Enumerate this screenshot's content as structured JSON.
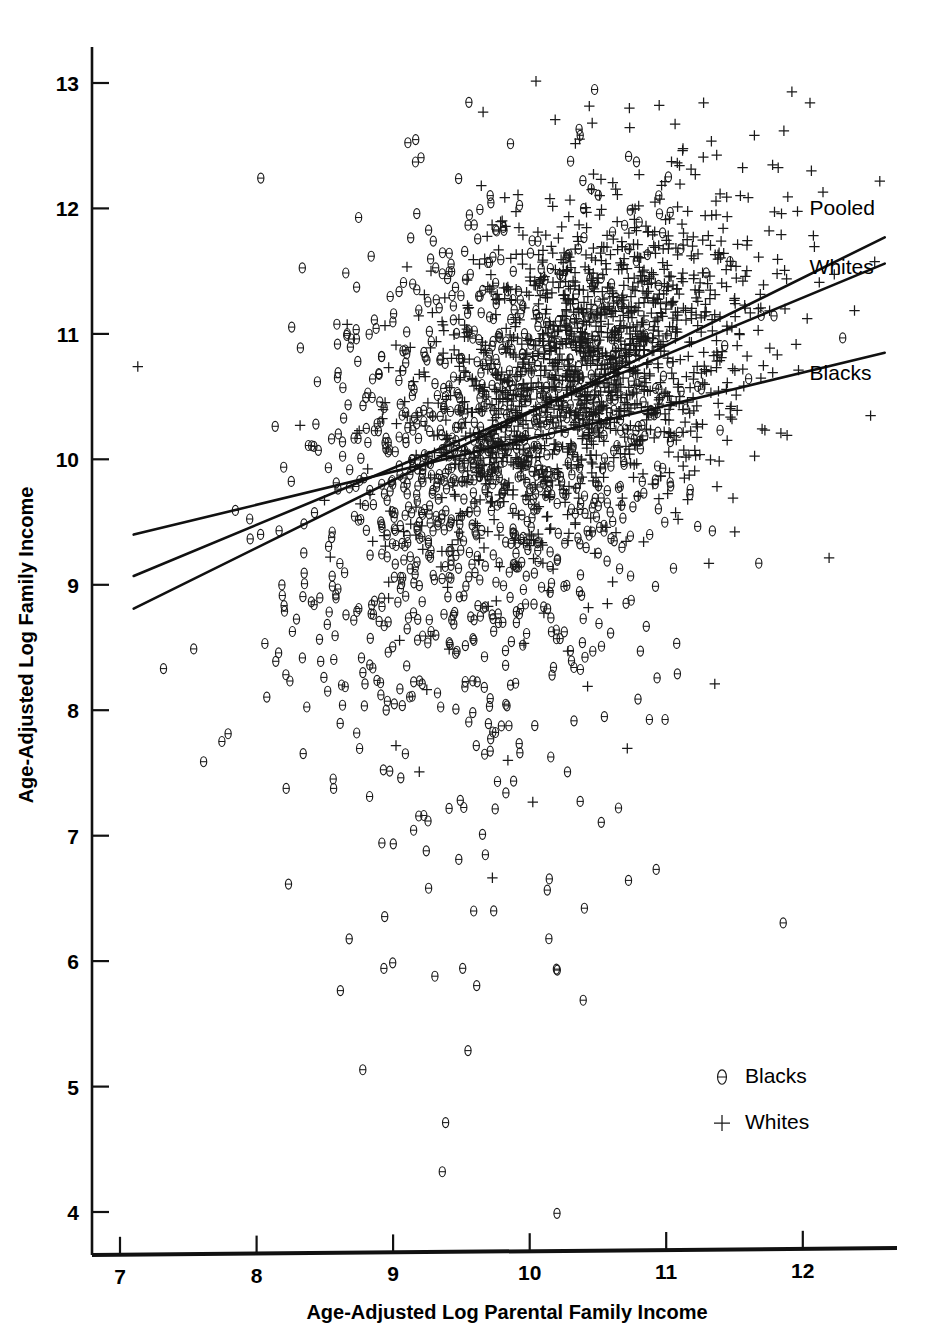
{
  "chart_data": {
    "type": "scatter",
    "title": "",
    "xlabel": "Age-Adjusted Log Parental Family Income",
    "ylabel": "Age-Adjusted Log Family Income",
    "xlim": [
      6.8,
      12.7
    ],
    "ylim": [
      3.65,
      13.35
    ],
    "xticks": [
      7,
      8,
      9,
      10,
      11,
      12
    ],
    "yticks": [
      4,
      5,
      6,
      7,
      8,
      9,
      10,
      11,
      12,
      13
    ],
    "xticklabels": [
      "7",
      "8",
      "9",
      "10",
      "11",
      "12"
    ],
    "yticklabels": [
      "4",
      "5",
      "6",
      "7",
      "8",
      "9",
      "10",
      "11",
      "12",
      "13"
    ],
    "grid": false,
    "legend_position": "lower right",
    "legend": [
      {
        "label": "Blacks",
        "marker": "circle-minus"
      },
      {
        "label": "Whites",
        "marker": "plus"
      }
    ],
    "series": [
      {
        "name": "Blacks",
        "marker": "circle-minus",
        "n_points": 1150,
        "x_mean": 9.72,
        "x_sd": 0.72,
        "y_mean": 9.95,
        "y_sd": 1.02,
        "corr": 0.34
      },
      {
        "name": "Whites",
        "marker": "plus",
        "n_points": 1500,
        "x_mean": 10.45,
        "x_sd": 0.62,
        "y_mean": 10.78,
        "y_sd": 0.72,
        "corr": 0.4
      }
    ],
    "fit_lines": [
      {
        "name": "Pooled",
        "label": "Pooled",
        "x0": 7.1,
        "y0": 8.81,
        "x1": 12.6,
        "y1": 11.77
      },
      {
        "name": "Whites",
        "label": "Whites",
        "x0": 7.1,
        "y0": 9.07,
        "x1": 12.6,
        "y1": 11.56
      },
      {
        "name": "Blacks",
        "label": "Blacks",
        "x0": 7.1,
        "y0": 9.4,
        "x1": 12.6,
        "y1": 10.85
      }
    ],
    "annotations": [
      {
        "text": "Pooled",
        "x": 12.05,
        "y": 11.95
      },
      {
        "text": "Whites",
        "x": 12.05,
        "y": 11.48
      },
      {
        "text": "Blacks",
        "x": 12.05,
        "y": 10.63
      }
    ],
    "notable_points": [
      {
        "series": "Whites",
        "x": 7.13,
        "y": 10.74
      },
      {
        "series": "Blacks",
        "x": 10.2,
        "y": 3.99
      },
      {
        "series": "Whites",
        "x": 11.92,
        "y": 12.93
      },
      {
        "series": "Whites",
        "x": 10.73,
        "y": 12.8
      }
    ],
    "colors": {
      "marker": "#1a1a1a",
      "line": "#111111",
      "background": "#ffffff",
      "axis": "#111111"
    }
  },
  "axes": {
    "x_title": "Age-Adjusted Log Parental Family Income",
    "y_title": "Age-Adjusted Log Family Income"
  }
}
